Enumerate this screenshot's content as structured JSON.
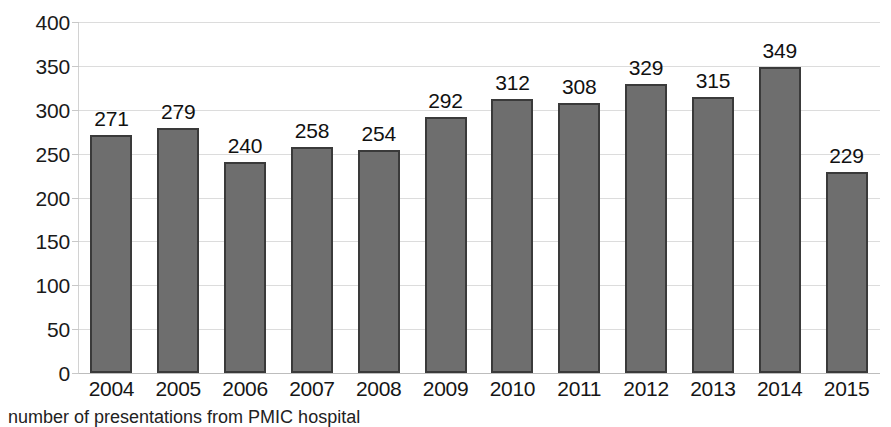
{
  "chart_data": {
    "type": "bar",
    "title": "",
    "subtitle": "",
    "xlabel": "",
    "ylabel": "",
    "categories": [
      "2004",
      "2005",
      "2006",
      "2007",
      "2008",
      "2009",
      "2010",
      "2011",
      "2012",
      "2013",
      "2014",
      "2015"
    ],
    "values": [
      271,
      279,
      240,
      258,
      254,
      292,
      312,
      308,
      329,
      315,
      349,
      229
    ],
    "data_labels": [
      "271",
      "279",
      "240",
      "258",
      "254",
      "292",
      "312",
      "308",
      "329",
      "315",
      "349",
      "229"
    ],
    "ylim": [
      0,
      400
    ],
    "ytick_values": [
      0,
      50,
      100,
      150,
      200,
      250,
      300,
      350,
      400
    ],
    "ytick_labels": [
      "0",
      "50",
      "100",
      "150",
      "200",
      "250",
      "300",
      "350",
      "400"
    ],
    "grid": true,
    "grid_axis": "y",
    "legend": null,
    "legend_position": "none",
    "series": [
      {
        "name": "presentations",
        "values": [
          271,
          279,
          240,
          258,
          254,
          292,
          312,
          308,
          329,
          315,
          349,
          229
        ]
      }
    ],
    "colors": {
      "bar_fill": "#6e6e6e",
      "bar_outline": "#3a3a3a",
      "gridline": "#dcdcdc",
      "axis_line": "#bdbdbd",
      "text": "#111111",
      "background": "#ffffff"
    }
  },
  "caption": {
    "text": "number of presentations from PMIC hospital"
  }
}
